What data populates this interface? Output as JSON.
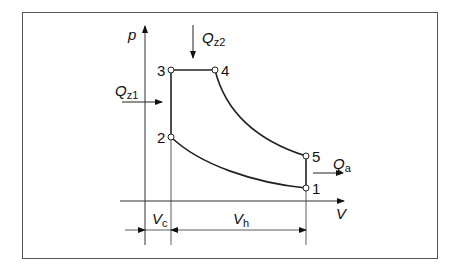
{
  "diagram": {
    "axes": {
      "y_label": "p",
      "x_label": "V"
    },
    "points": [
      {
        "id": "1",
        "label": "1"
      },
      {
        "id": "2",
        "label": "2"
      },
      {
        "id": "3",
        "label": "3"
      },
      {
        "id": "4",
        "label": "4"
      },
      {
        "id": "5",
        "label": "5"
      }
    ],
    "heat_flows": {
      "qz1": {
        "symbol": "Q",
        "subscript": "z1"
      },
      "qz2": {
        "symbol": "Q",
        "subscript": "z2"
      },
      "qa": {
        "symbol": "Q",
        "subscript": "a"
      }
    },
    "dimensions": {
      "vc": {
        "symbol": "V",
        "subscript": "c"
      },
      "vh": {
        "symbol": "V",
        "subscript": "h"
      }
    }
  }
}
